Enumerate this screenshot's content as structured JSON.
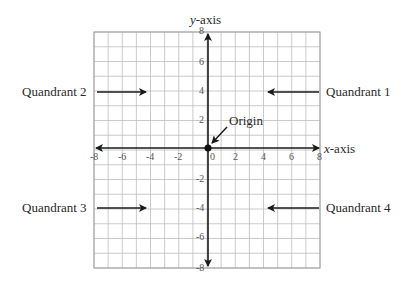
{
  "diagram": {
    "grid": {
      "min": -8,
      "max": 8,
      "step": 1,
      "label_step": 2
    },
    "axes": {
      "x": {
        "label_var": "x",
        "label_suffix": "-axis"
      },
      "y": {
        "label_var": "y",
        "label_suffix": "-axis"
      }
    },
    "x_ticks": [
      "-8",
      "-6",
      "-4",
      "-2",
      "0",
      "2",
      "4",
      "6",
      "8"
    ],
    "y_ticks": [
      "8",
      "6",
      "4",
      "2",
      "-2",
      "-4",
      "-6",
      "-8"
    ],
    "origin_label": "Origin",
    "quadrants": {
      "q1": "Quandrant 1",
      "q2": "Quandrant 2",
      "q3": "Quandrant 3",
      "q4": "Quandrant 4"
    },
    "colors": {
      "grid": "#bdbdbd",
      "axis": "#1a1a1a",
      "text": "#2a2a2a"
    }
  }
}
